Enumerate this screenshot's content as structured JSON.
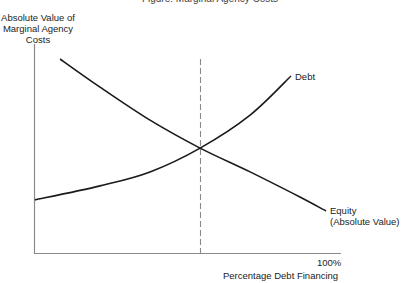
{
  "chart_data": {
    "type": "line",
    "xlabel": "Percentage Debt Financing",
    "ylabel": "Absolute Value of Marginal Agency Costs",
    "ylabel_lines": [
      "Absolute Value of",
      "Marginal Agency",
      "Costs"
    ],
    "xlim": [
      0,
      100
    ],
    "ylim": [
      0,
      100
    ],
    "x_ticks": [
      {
        "value": 100,
        "label": "100%"
      }
    ],
    "y_ticks": [],
    "grid": false,
    "legend": "inline labels at curve ends",
    "series": [
      {
        "name": "Debt",
        "label": "Debt",
        "points": [
          [
            0.3,
            25.4
          ],
          [
            21.5,
            32.1
          ],
          [
            37.8,
            38.8
          ],
          [
            54.1,
            50.2
          ],
          [
            70.4,
            66.0
          ],
          [
            83.7,
            84.7
          ]
        ]
      },
      {
        "name": "Equity (Absolute Value)",
        "label_lines": [
          "Equity",
          "(Absolute Value)"
        ],
        "points": [
          [
            8.5,
            92.8
          ],
          [
            21.5,
            79.4
          ],
          [
            37.8,
            63.6
          ],
          [
            54.1,
            50.2
          ],
          [
            70.4,
            38.8
          ],
          [
            86.6,
            26.8
          ],
          [
            95.1,
            20.1
          ]
        ]
      }
    ],
    "annotations": [
      {
        "type": "vertical-dashed-line",
        "x": 54.1,
        "description": "Optimal debt ratio where marginal agency costs of debt and equity are equal"
      }
    ]
  },
  "labels": {
    "cut_title": "Figure: Marginal Agency Costs",
    "ylabel": [
      "Absolute Value of",
      "Marginal Agency",
      "Costs"
    ],
    "debt": "Debt",
    "equity": [
      "Equity",
      "(Absolute Value)"
    ],
    "x_tick_100": "100%",
    "xlabel": "Percentage Debt Financing"
  },
  "colors": {
    "axis": "#8a8a8a",
    "curve": "#1a1a1a",
    "dashed": "#8a8a8a",
    "text": "#222222"
  }
}
